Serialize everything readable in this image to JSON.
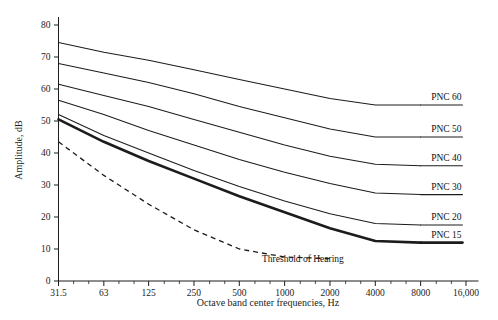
{
  "chart_data": {
    "type": "line",
    "title": "",
    "xlabel": "Octave band center frequencies, Hz",
    "ylabel": "Amplitude, dB",
    "xscale": "log2-octave",
    "x": [
      31.5,
      63,
      125,
      250,
      500,
      1000,
      2000,
      4000,
      8000
    ],
    "xtick_labels": [
      "31.5",
      "63",
      "125",
      "250",
      "500",
      "1000",
      "2000",
      "4000",
      "8000",
      "16,000"
    ],
    "xtick_values": [
      31.5,
      63,
      125,
      250,
      500,
      1000,
      2000,
      4000,
      8000,
      16000
    ],
    "ytick_labels": [
      "0",
      "10",
      "20",
      "30",
      "40",
      "50",
      "60",
      "70",
      "80"
    ],
    "ytick_values": [
      0,
      10,
      20,
      30,
      40,
      50,
      60,
      70,
      80
    ],
    "ylim": [
      0,
      80
    ],
    "xlim": [
      31.5,
      16000
    ],
    "grid": false,
    "minor_ticks": true,
    "legend": "inline-right-labels",
    "series": [
      {
        "name": "PNC 60",
        "label": "PNC 60",
        "emphasis": false,
        "style": "solid",
        "x": [
          31.5,
          63,
          125,
          250,
          500,
          1000,
          2000,
          4000,
          8000
        ],
        "values": [
          74.5,
          71.5,
          69,
          66,
          63,
          60,
          57,
          55,
          55
        ]
      },
      {
        "name": "PNC 50",
        "label": "PNC 50",
        "emphasis": false,
        "style": "solid",
        "x": [
          31.5,
          63,
          125,
          250,
          500,
          1000,
          2000,
          4000,
          8000
        ],
        "values": [
          68,
          65,
          62,
          58.5,
          54.5,
          51,
          47.5,
          45,
          45
        ]
      },
      {
        "name": "PNC 40",
        "label": "PNC 40",
        "emphasis": false,
        "style": "solid",
        "x": [
          31.5,
          63,
          125,
          250,
          500,
          1000,
          2000,
          4000,
          8000
        ],
        "values": [
          61.5,
          58,
          54.5,
          50.5,
          46.5,
          42.5,
          39,
          36.5,
          36
        ]
      },
      {
        "name": "PNC 30",
        "label": "PNC 30",
        "emphasis": false,
        "style": "solid",
        "x": [
          31.5,
          63,
          125,
          250,
          500,
          1000,
          2000,
          4000,
          8000
        ],
        "values": [
          56.5,
          52,
          47,
          42.5,
          38,
          34,
          30.5,
          27.5,
          27
        ]
      },
      {
        "name": "PNC 20",
        "label": "PNC 20",
        "emphasis": false,
        "style": "solid",
        "x": [
          31.5,
          63,
          125,
          250,
          500,
          1000,
          2000,
          4000,
          8000
        ],
        "values": [
          52,
          45.5,
          40,
          34.5,
          29.5,
          25,
          21,
          18,
          17.5
        ]
      },
      {
        "name": "PNC 15",
        "label": "PNC 15",
        "emphasis": true,
        "style": "solid-bold",
        "x": [
          31.5,
          63,
          125,
          250,
          500,
          1000,
          2000,
          4000,
          8000
        ],
        "values": [
          50.5,
          43.5,
          37.5,
          32,
          26.5,
          21.5,
          16.5,
          12.5,
          12
        ]
      },
      {
        "name": "Threshold of Hearing",
        "label": "Threshold of Hearing",
        "emphasis": false,
        "style": "dashed",
        "x": [
          31.5,
          63,
          125,
          250,
          500,
          1000,
          2000
        ],
        "values": [
          43.5,
          33,
          24,
          16,
          10,
          7.5,
          7
        ]
      }
    ],
    "annotations": [
      {
        "text": "Threshold of Hearing",
        "x": 800,
        "y": 7
      }
    ]
  },
  "axis": {
    "y_title": "Amplitude, dB",
    "x_title": "Octave band center frequencies, Hz"
  },
  "colors": {
    "ink": "#1c1c1c",
    "background": "#ffffff"
  }
}
